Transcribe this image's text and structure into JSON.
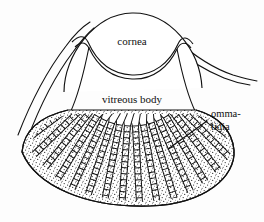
{
  "figure": {
    "name": "compound-eye-cross-section",
    "background_color": "#fdfdfd",
    "ink_color": "#111111",
    "labels": {
      "cornea": "cornea",
      "vitreous_body": "vitreous body",
      "ommatidia_line1": "omma-",
      "ommatidia_line2": "tidia"
    },
    "structures": [
      "cornea",
      "vitreous body",
      "ommatidia",
      "cuticle fold left",
      "cuticle fold right",
      "stippled pigment layer"
    ],
    "annotations": [
      {
        "label": "ommatidia",
        "leader_from": [
          209,
          122
        ],
        "leader_to": [
          168,
          148
        ]
      }
    ]
  }
}
